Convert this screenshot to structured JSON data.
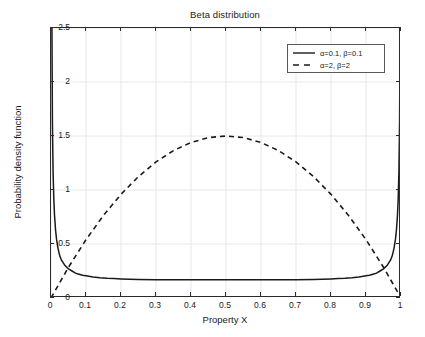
{
  "chart_data": {
    "type": "line",
    "title": "Beta distribution",
    "xlabel": "Property X",
    "ylabel": "Probability density function",
    "xlim": [
      0,
      1
    ],
    "ylim": [
      0,
      2.5
    ],
    "xticks": [
      "0",
      "0.1",
      "0.2",
      "0.3",
      "0.4",
      "0.5",
      "0.6",
      "0.7",
      "0.8",
      "0.9",
      "1"
    ],
    "xtick_values": [
      0,
      0.1,
      0.2,
      0.3,
      0.4,
      0.5,
      0.6,
      0.7,
      0.8,
      0.9,
      1
    ],
    "yticks": [
      "0",
      "0.5",
      "1",
      "1.5",
      "2",
      "2.5"
    ],
    "ytick_values": [
      0,
      0.5,
      1,
      1.5,
      2,
      2.5
    ],
    "grid": true,
    "grid_color": "#e8e8e8",
    "legend_position": "upper right",
    "line_color": "#1a1a1a",
    "series": [
      {
        "name": "α=0.1, β=0.1",
        "alpha": 0.1,
        "beta": 0.1,
        "style": "solid",
        "x": [
          0.002,
          0.004,
          0.006,
          0.008,
          0.01,
          0.013,
          0.016,
          0.02,
          0.025,
          0.03,
          0.04,
          0.05,
          0.06,
          0.07,
          0.08,
          0.09,
          0.1,
          0.12,
          0.14,
          0.16,
          0.18,
          0.2,
          0.25,
          0.3,
          0.35,
          0.4,
          0.45,
          0.5,
          0.55,
          0.6,
          0.65,
          0.7,
          0.75,
          0.8,
          0.82,
          0.84,
          0.86,
          0.88,
          0.9,
          0.91,
          0.92,
          0.93,
          0.94,
          0.95,
          0.96,
          0.97,
          0.975,
          0.98,
          0.984,
          0.987,
          0.99,
          0.992,
          0.994,
          0.996,
          0.998
        ],
        "y": [
          2.93,
          1.64,
          1.16,
          0.92,
          0.77,
          0.63,
          0.54,
          0.46,
          0.39,
          0.35,
          0.3,
          0.27,
          0.25,
          0.23,
          0.22,
          0.21,
          0.205,
          0.195,
          0.188,
          0.183,
          0.18,
          0.177,
          0.172,
          0.17,
          0.169,
          0.168,
          0.168,
          0.168,
          0.168,
          0.168,
          0.169,
          0.17,
          0.172,
          0.177,
          0.18,
          0.183,
          0.188,
          0.195,
          0.205,
          0.21,
          0.22,
          0.23,
          0.25,
          0.27,
          0.3,
          0.35,
          0.39,
          0.46,
          0.54,
          0.63,
          0.77,
          0.92,
          1.16,
          1.64,
          2.93
        ]
      },
      {
        "name": "α=2, β=2",
        "alpha": 2,
        "beta": 2,
        "style": "dashed",
        "x": [
          0,
          0.05,
          0.1,
          0.15,
          0.2,
          0.25,
          0.3,
          0.35,
          0.4,
          0.45,
          0.5,
          0.55,
          0.6,
          0.65,
          0.7,
          0.75,
          0.8,
          0.85,
          0.9,
          0.95,
          1.0
        ],
        "y": [
          0,
          0.285,
          0.54,
          0.765,
          0.96,
          1.125,
          1.26,
          1.365,
          1.44,
          1.485,
          1.5,
          1.485,
          1.44,
          1.365,
          1.26,
          1.125,
          0.96,
          0.765,
          0.54,
          0.285,
          0
        ]
      }
    ],
    "annotations": [
      {
        "label": "peak of Beta(2,2)",
        "x": 0.5,
        "y": 1.5
      },
      {
        "label": "minimum of Beta(0.1,0.1)",
        "x": 0.5,
        "y": 0.168
      }
    ]
  }
}
